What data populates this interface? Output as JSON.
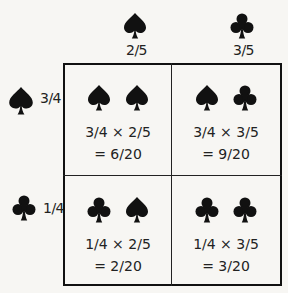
{
  "columns": [
    {
      "suit": "spade",
      "icon": "spade-icon",
      "probability": "2/5"
    },
    {
      "suit": "club",
      "icon": "club-icon",
      "probability": "3/5"
    }
  ],
  "rows": [
    {
      "suit": "spade",
      "icon": "spade-icon",
      "probability": "3/4"
    },
    {
      "suit": "club",
      "icon": "club-icon",
      "probability": "1/4"
    }
  ],
  "cells": [
    {
      "suits": [
        "spade",
        "spade"
      ],
      "expression": "3/4 × 2/5",
      "result": "= 6/20"
    },
    {
      "suits": [
        "spade",
        "club"
      ],
      "expression": "3/4 × 3/5",
      "result": "= 9/20"
    },
    {
      "suits": [
        "club",
        "spade"
      ],
      "expression": "1/4 × 2/5",
      "result": "= 2/20"
    },
    {
      "suits": [
        "club",
        "club"
      ],
      "expression": "1/4 × 3/5",
      "result": "= 3/20"
    }
  ],
  "colors": {
    "ink": "#111111",
    "background": "#f7f6f3"
  }
}
